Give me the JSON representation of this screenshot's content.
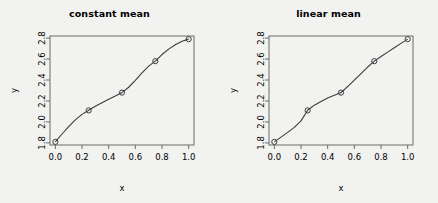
{
  "figure": {
    "background_color": "#f2f2f0",
    "panel_count": 2
  },
  "chart_data": [
    {
      "type": "line",
      "title": "constant mean",
      "xlabel": "x",
      "ylabel": "y",
      "xlim": [
        -0.04,
        1.04
      ],
      "ylim": [
        1.78,
        2.82
      ],
      "grid": false,
      "legend": null,
      "xticks": [
        "0.0",
        "0.2",
        "0.4",
        "0.6",
        "0.8",
        "1.0"
      ],
      "xtick_values": [
        0.0,
        0.2,
        0.4,
        0.6,
        0.8,
        1.0
      ],
      "yticks": [
        "1.8",
        "2.0",
        "2.2",
        "2.4",
        "2.6",
        "2.8"
      ],
      "ytick_values": [
        1.8,
        2.0,
        2.2,
        2.4,
        2.6,
        2.8
      ],
      "series": [
        {
          "name": "posterior mean",
          "style": "curve",
          "color": "#3c3c3c",
          "x": [
            0.0,
            0.05,
            0.1,
            0.15,
            0.2,
            0.25,
            0.3,
            0.35,
            0.4,
            0.45,
            0.5,
            0.55,
            0.6,
            0.65,
            0.7,
            0.75,
            0.8,
            0.85,
            0.9,
            0.95,
            1.0
          ],
          "y": [
            1.81,
            1.885,
            1.955,
            2.02,
            2.072,
            2.112,
            2.149,
            2.183,
            2.217,
            2.248,
            2.28,
            2.331,
            2.397,
            2.468,
            2.532,
            2.58,
            2.643,
            2.695,
            2.737,
            2.77,
            2.79
          ]
        },
        {
          "name": "observations",
          "style": "points",
          "marker": "open-circle",
          "color": "#3c3c3c",
          "x": [
            0.0,
            0.25,
            0.5,
            0.75,
            1.0
          ],
          "y": [
            1.81,
            2.11,
            2.28,
            2.58,
            2.79
          ]
        }
      ]
    },
    {
      "type": "line",
      "title": "linear mean",
      "xlabel": "x",
      "ylabel": "y",
      "xlim": [
        -0.04,
        1.04
      ],
      "ylim": [
        1.78,
        2.82
      ],
      "grid": false,
      "legend": null,
      "xticks": [
        "0.0",
        "0.2",
        "0.4",
        "0.6",
        "0.8",
        "1.0"
      ],
      "xtick_values": [
        0.0,
        0.2,
        0.4,
        0.6,
        0.8,
        1.0
      ],
      "yticks": [
        "1.8",
        "2.0",
        "2.2",
        "2.4",
        "2.6",
        "2.8"
      ],
      "ytick_values": [
        1.8,
        2.0,
        2.2,
        2.4,
        2.6,
        2.8
      ],
      "series": [
        {
          "name": "posterior mean",
          "style": "curve",
          "color": "#3c3c3c",
          "x": [
            0.0,
            0.05,
            0.1,
            0.15,
            0.2,
            0.25,
            0.3,
            0.35,
            0.4,
            0.45,
            0.5,
            0.55,
            0.6,
            0.65,
            0.7,
            0.75,
            0.8,
            0.85,
            0.9,
            0.95,
            1.0
          ],
          "y": [
            1.81,
            1.855,
            1.9,
            1.948,
            2.01,
            2.112,
            2.16,
            2.196,
            2.229,
            2.254,
            2.28,
            2.338,
            2.4,
            2.462,
            2.524,
            2.58,
            2.625,
            2.666,
            2.708,
            2.75,
            2.79
          ]
        },
        {
          "name": "observations",
          "style": "points",
          "marker": "open-circle",
          "color": "#3c3c3c",
          "x": [
            0.0,
            0.25,
            0.5,
            0.75,
            1.0
          ],
          "y": [
            1.81,
            2.11,
            2.28,
            2.58,
            2.79
          ]
        }
      ]
    }
  ]
}
